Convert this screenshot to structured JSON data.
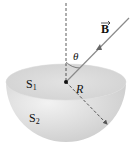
{
  "diagram": {
    "labels": {
      "field": "B",
      "angle": "θ",
      "radius": "R",
      "surface_flat": "S",
      "surface_flat_sub": "1",
      "surface_curved": "S",
      "surface_curved_sub": "2"
    },
    "colors": {
      "hemisphere_light": "#ececec",
      "hemisphere_dark": "#c8c8c8",
      "line": "#333333",
      "arrow": "#8a8a8a"
    }
  }
}
